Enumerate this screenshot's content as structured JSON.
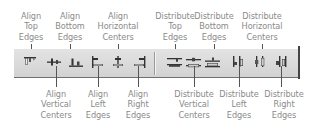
{
  "toolbar": {
    "name": "Align and Distribute toolbar",
    "colors": {
      "background": "#dcdcdc",
      "icon": "#3a3a3a",
      "label_text": "#8a8a8a",
      "leader_line": "#555555"
    },
    "buttons": [
      {
        "id": "align-top-edges",
        "icon": "align-top-edges-icon",
        "label": [
          "Align",
          "Top",
          "Edges"
        ]
      },
      {
        "id": "align-vertical-centers",
        "icon": "align-vertical-centers-icon",
        "label": [
          "Align",
          "Vertical",
          "Centers"
        ]
      },
      {
        "id": "align-bottom-edges",
        "icon": "align-bottom-edges-icon",
        "label": [
          "Align",
          "Bottom",
          "Edges"
        ]
      },
      {
        "id": "align-left-edges",
        "icon": "align-left-edges-icon",
        "label": [
          "Align",
          "Left",
          "Edges"
        ]
      },
      {
        "id": "align-horizontal-centers",
        "icon": "align-horizontal-centers-icon",
        "label": [
          "Align",
          "Horizontal",
          "Centers"
        ]
      },
      {
        "id": "align-right-edges",
        "icon": "align-right-edges-icon",
        "label": [
          "Align",
          "Right",
          "Edges"
        ]
      },
      {
        "id": "distribute-top-edges",
        "icon": "distribute-top-edges-icon",
        "label": [
          "Distribute",
          "Top",
          "Edges"
        ]
      },
      {
        "id": "distribute-vertical-centers",
        "icon": "distribute-vertical-centers-icon",
        "label": [
          "Distribute",
          "Vertical",
          "Centers"
        ]
      },
      {
        "id": "distribute-bottom-edges",
        "icon": "distribute-bottom-edges-icon",
        "label": [
          "Distribute",
          "Bottom",
          "Edges"
        ]
      },
      {
        "id": "distribute-left-edges",
        "icon": "distribute-left-edges-icon",
        "label": [
          "Distribute",
          "Left",
          "Edges"
        ]
      },
      {
        "id": "distribute-horizontal-centers",
        "icon": "distribute-horizontal-centers-icon",
        "label": [
          "Distribute",
          "Horizontal",
          "Centers"
        ]
      },
      {
        "id": "distribute-right-edges",
        "icon": "distribute-right-edges-icon",
        "label": [
          "Distribute",
          "Right",
          "Edges"
        ]
      }
    ]
  }
}
